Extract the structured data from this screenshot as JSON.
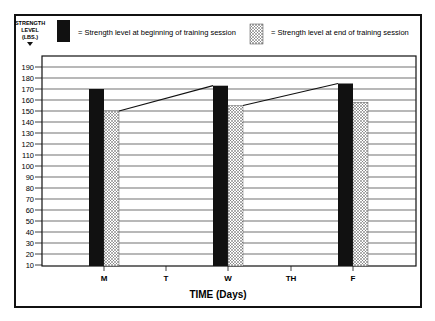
{
  "chart_data": {
    "type": "bar",
    "title": "",
    "ylabel": "STRENGTH LEVEL (LBS.)",
    "xlabel": "TIME (Days)",
    "categories": [
      "M",
      "T",
      "W",
      "TH",
      "F"
    ],
    "series": [
      {
        "name": "Strength level at beginning of training session",
        "style": "solid-black",
        "values": [
          170,
          null,
          173,
          null,
          175
        ]
      },
      {
        "name": "Strength level at end of training session",
        "style": "dotted",
        "values": [
          150,
          null,
          155,
          null,
          158
        ]
      }
    ],
    "connector_lines": [
      {
        "from": {
          "day": "M",
          "series": "end",
          "value": 150
        },
        "to": {
          "day": "W",
          "series": "beginning",
          "value": 173
        }
      },
      {
        "from": {
          "day": "W",
          "series": "end",
          "value": 155
        },
        "to": {
          "day": "F",
          "series": "beginning",
          "value": 175
        }
      }
    ],
    "yticks": [
      10,
      20,
      30,
      40,
      50,
      60,
      70,
      80,
      90,
      100,
      110,
      120,
      130,
      140,
      150,
      160,
      170,
      180,
      190
    ],
    "ylim": [
      10,
      195
    ],
    "grid": true,
    "legend_position": "top"
  },
  "ylabel_lines": [
    "STRENGTH",
    "LEVEL",
    "(LBS.)"
  ],
  "legend": {
    "begin_label": "= Strength level at beginning of training session",
    "end_label": "= Strength level at end of training session"
  },
  "xaxis_title": "TIME (Days)"
}
